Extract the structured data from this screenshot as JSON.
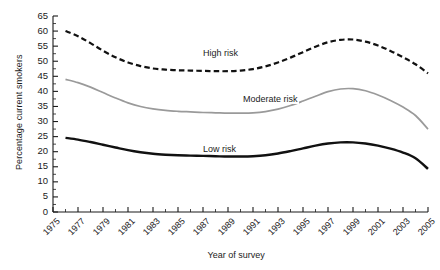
{
  "chart_data": {
    "type": "line",
    "title": "",
    "xlabel": "Year of survey",
    "ylabel": "Percentage current smokers",
    "xlim": [
      1975,
      2005
    ],
    "ylim": [
      0,
      65
    ],
    "ytick_step": 5,
    "yminor_step": 2.5,
    "xtick_step": 2,
    "xminor_step": 1,
    "grid": "off",
    "legend": "inline-annotations",
    "ytick_labels": [
      "0",
      "5",
      "10",
      "15",
      "20",
      "25",
      "30",
      "35",
      "40",
      "45",
      "50",
      "55",
      "60",
      "65"
    ],
    "xtick_labels": [
      "1975",
      "1977",
      "1979",
      "1981",
      "1983",
      "1985",
      "1987",
      "1989",
      "1991",
      "1993",
      "1995",
      "1997",
      "1999",
      "2001",
      "2003",
      "2005"
    ],
    "x": [
      1976,
      1977,
      1978,
      1979,
      1980,
      1981,
      1982,
      1983,
      1984,
      1985,
      1986,
      1987,
      1988,
      1989,
      1990,
      1991,
      1992,
      1993,
      1994,
      1995,
      1996,
      1997,
      1998,
      1999,
      2000,
      2001,
      2002,
      2003,
      2004,
      2005
    ],
    "series": [
      {
        "name": "High risk",
        "style": "dashed",
        "color": "#111111",
        "width": 2.2,
        "label_x": 1989,
        "label_y": 52.5,
        "values": [
          60.0,
          58.3,
          56.0,
          53.5,
          51.3,
          49.6,
          48.4,
          47.6,
          47.2,
          47.0,
          46.9,
          46.8,
          46.7,
          46.7,
          46.9,
          47.4,
          48.3,
          49.6,
          51.2,
          53.0,
          54.8,
          56.3,
          57.1,
          57.2,
          56.5,
          55.2,
          53.4,
          51.3,
          49.0,
          46.0
        ]
      },
      {
        "name": "Moderate risk",
        "style": "solid",
        "color": "#9a9a9a",
        "width": 1.7,
        "label_x": 1992.2,
        "label_y": 37.2,
        "values": [
          44.0,
          42.9,
          41.4,
          39.6,
          37.8,
          36.2,
          35.0,
          34.2,
          33.7,
          33.4,
          33.2,
          33.0,
          32.9,
          32.8,
          32.8,
          32.9,
          33.3,
          34.1,
          35.3,
          36.8,
          38.4,
          39.9,
          40.8,
          40.9,
          40.2,
          38.8,
          37.0,
          34.8,
          32.0,
          27.5
        ]
      },
      {
        "name": "Low risk",
        "style": "solid",
        "color": "#111111",
        "width": 2.4,
        "label_x": 1989,
        "label_y": 20.6,
        "values": [
          24.6,
          24.0,
          23.2,
          22.3,
          21.4,
          20.5,
          19.8,
          19.3,
          19.0,
          18.8,
          18.7,
          18.6,
          18.5,
          18.4,
          18.4,
          18.5,
          18.8,
          19.4,
          20.2,
          21.1,
          22.0,
          22.7,
          23.1,
          23.1,
          22.7,
          22.0,
          21.0,
          19.7,
          17.8,
          14.3
        ]
      }
    ]
  },
  "axis": {
    "y_title": "Percentage current smokers",
    "x_title": "Year of survey"
  }
}
